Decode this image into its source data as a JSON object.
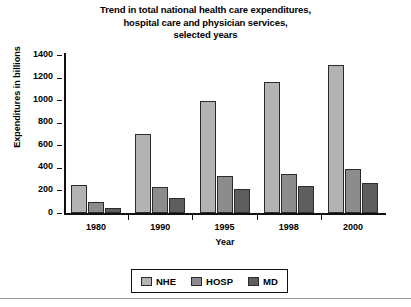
{
  "chart_data": {
    "type": "bar",
    "title": "Trend in total national health care expenditures, hospital care and physician services, selected years",
    "title_lines": [
      "Trend in total national health care expenditures,",
      "hospital care and physician services,",
      "selected years"
    ],
    "xlabel": "Year",
    "ylabel": "Expenditures in billions",
    "categories": [
      "1980",
      "1990",
      "1995",
      "1998",
      "2000"
    ],
    "ylim": [
      0,
      1400
    ],
    "yticks": [
      0,
      200,
      400,
      600,
      800,
      1000,
      1200,
      1400
    ],
    "grid": false,
    "legend_position": "bottom",
    "series": [
      {
        "name": "NHE",
        "color": "#b3b3b3",
        "values": [
          250,
          700,
          990,
          1160,
          1310
        ]
      },
      {
        "name": "HOSP",
        "color": "#8c8c8c",
        "values": [
          100,
          230,
          330,
          350,
          390
        ]
      },
      {
        "name": "MD",
        "color": "#5e5e5e",
        "values": [
          45,
          130,
          210,
          235,
          270
        ]
      }
    ]
  }
}
